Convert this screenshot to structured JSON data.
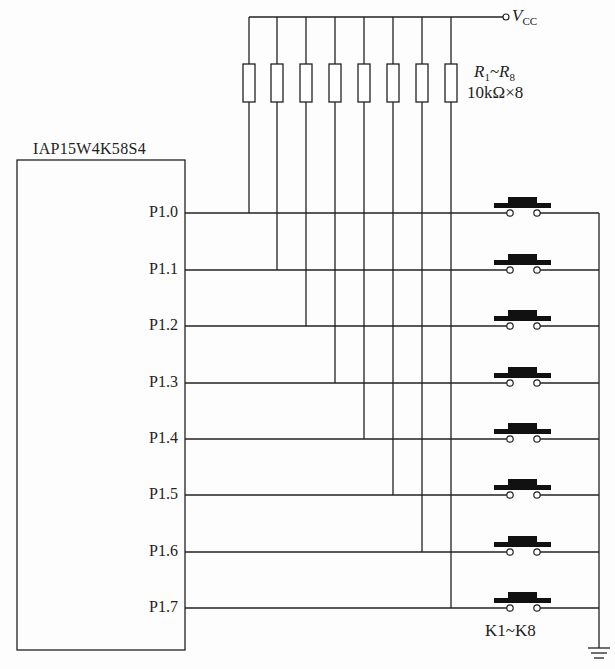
{
  "chip": {
    "name": "IAP15W4K58S4",
    "pins": [
      "P1.0",
      "P1.1",
      "P1.2",
      "P1.3",
      "P1.4",
      "P1.5",
      "P1.6",
      "P1.7"
    ]
  },
  "supply": {
    "symbol": "V",
    "subscript": "CC"
  },
  "resistors": {
    "range_start": "R",
    "range_start_sub": "1",
    "range_sep": "~",
    "range_end": "R",
    "range_end_sub": "8",
    "value": "10kΩ×8",
    "count": 8
  },
  "switches": {
    "label": "K1~K8",
    "count": 8
  },
  "ground": {
    "symbol": "ground"
  }
}
